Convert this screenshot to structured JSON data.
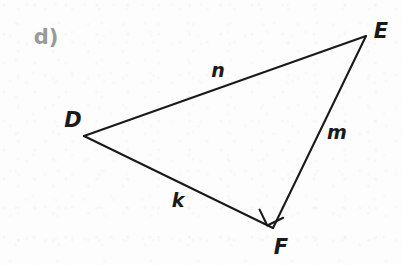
{
  "figure": {
    "part_label": "d)",
    "part_label_color": "#9a9a9a",
    "stroke_color": "#1a1a1a",
    "background_color": "#fdfdfd",
    "shape": "right-triangle",
    "vertices": [
      {
        "name": "D",
        "label": "D",
        "x": 84,
        "y": 136,
        "label_x": 73,
        "label_y": 120
      },
      {
        "name": "E",
        "label": "E",
        "x": 366,
        "y": 36,
        "label_x": 381,
        "label_y": 31
      },
      {
        "name": "F",
        "label": "F",
        "x": 273,
        "y": 228,
        "label_x": 281,
        "label_y": 247
      }
    ],
    "sides": [
      {
        "name": "DE",
        "label": "n",
        "from": "D",
        "to": "E",
        "label_x": 218,
        "label_y": 70
      },
      {
        "name": "EF",
        "label": "m",
        "from": "E",
        "to": "F",
        "label_x": 337,
        "label_y": 132
      },
      {
        "name": "DF",
        "label": "k",
        "from": "D",
        "to": "F",
        "label_x": 178,
        "label_y": 200
      }
    ],
    "right_angle": {
      "at_vertex": "F",
      "marker": "square",
      "size": 16
    }
  }
}
